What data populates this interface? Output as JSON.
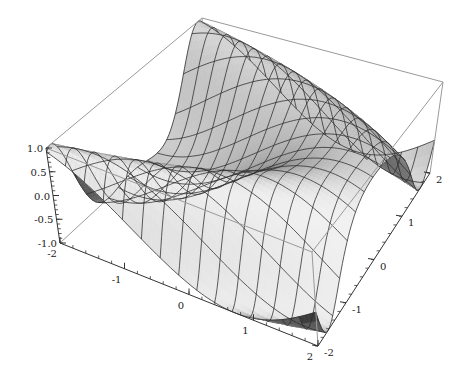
{
  "chart_data": {
    "type": "surface3d",
    "title": "",
    "function": "sin(x + y^2)",
    "x": {
      "label": "",
      "range": [
        -2,
        2
      ],
      "ticks": [
        -2,
        -1,
        0,
        1,
        2
      ],
      "tick_labels": [
        "-2",
        "-1",
        "0",
        "1",
        "2"
      ]
    },
    "y": {
      "label": "",
      "range": [
        -2,
        2
      ],
      "ticks": [
        -2,
        -1,
        0,
        1,
        2
      ],
      "tick_labels": [
        "-2",
        "-1",
        "0",
        "1",
        "2"
      ]
    },
    "z": {
      "label": "",
      "range": [
        -1,
        1
      ],
      "ticks": [
        -1.0,
        -0.5,
        0.0,
        0.5,
        1.0
      ],
      "tick_labels": [
        "-1.0",
        "-0.5",
        "0.0",
        "0.5",
        "1.0"
      ]
    },
    "mesh": {
      "lines_x": 15,
      "lines_y": 15
    },
    "bounding_box": true,
    "colors": {
      "surface_light": "#f2f2f2",
      "surface_dark": "#5a5a5a",
      "underside": "#3c3c3c",
      "mesh": "#2a2a2a",
      "box": "#9a9a9a",
      "axis": "#333333"
    }
  }
}
